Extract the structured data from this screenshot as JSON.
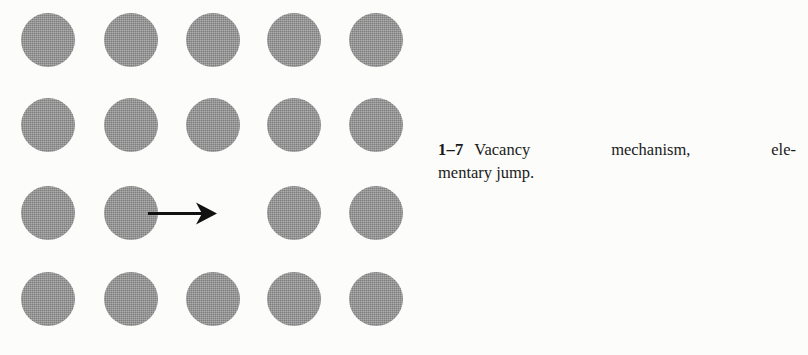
{
  "figure": {
    "background_color": "#fcfcfb",
    "atom_color": "#8c8c8c",
    "arrow_color": "#111111",
    "lattice": {
      "columns": 5,
      "rows": 4,
      "circle_diameter": 54,
      "column_centers_x": [
        48,
        131,
        213,
        294,
        376
      ],
      "row_centers_y": [
        40,
        125,
        213,
        299
      ],
      "occupancy": [
        [
          true,
          true,
          true,
          true,
          true
        ],
        [
          true,
          true,
          true,
          true,
          true
        ],
        [
          true,
          true,
          false,
          true,
          true
        ],
        [
          true,
          true,
          true,
          true,
          true
        ]
      ],
      "vacancy": {
        "row": 3,
        "column": 3
      }
    },
    "arrow": {
      "from_x": 150,
      "to_x": 216,
      "y": 213,
      "shaft_thickness": 3,
      "direction": "right",
      "label": "elementary jump direction"
    }
  },
  "caption": {
    "number": "1–7",
    "line_1_words": [
      "Vacancy",
      "mechanism,",
      "ele-"
    ],
    "line_2": "mentary jump.",
    "full_text": "1–7 Vacancy mechanism, elementary jump."
  }
}
